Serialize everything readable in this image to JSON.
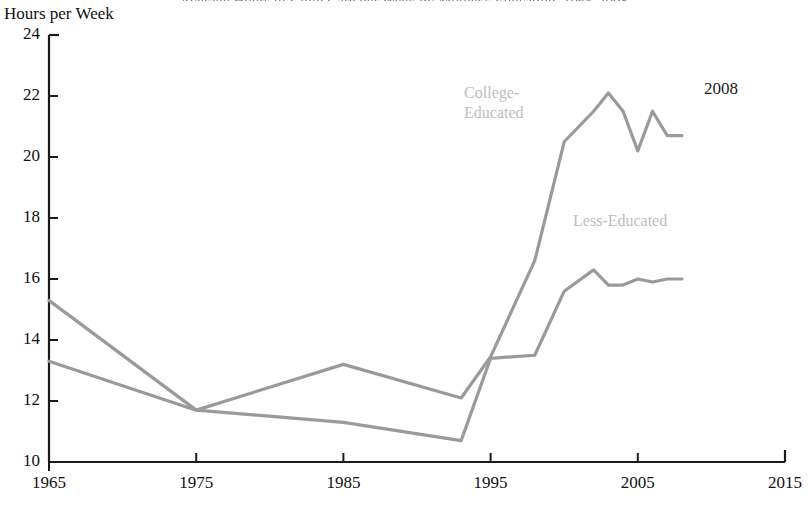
{
  "figure": {
    "clipped_title": "Average Hours of Child Care per Week by Mother's Education, 1965-2008",
    "y_axis_title": "Hours per Week",
    "annotation": "2008"
  },
  "chart_data": {
    "type": "line",
    "title": "",
    "xlabel": "",
    "ylabel": "Hours per Week",
    "xlim": [
      1965,
      2015
    ],
    "ylim": [
      10,
      24
    ],
    "xticks": [
      1965,
      1975,
      1985,
      1995,
      2005,
      2015
    ],
    "yticks": [
      10,
      12,
      14,
      16,
      18,
      20,
      22,
      24
    ],
    "grid": false,
    "legend_position": "inline-labels",
    "line_color": "#9a9a9a",
    "axis_color": "#1a1a1a",
    "label_color": "#bdbdbd",
    "annotations": [
      {
        "text": "2008",
        "x": 2009.5,
        "y": 22.2
      }
    ],
    "series": [
      {
        "name": "College-Educated",
        "label_lines": [
          "College-",
          "Educated"
        ],
        "label_x": 1993.2,
        "label_y": 22.1,
        "x": [
          1965,
          1975,
          1985,
          1993,
          1995,
          1998,
          2000,
          2002,
          2003,
          2004,
          2005,
          2006,
          2007,
          2008
        ],
        "values": [
          15.3,
          11.7,
          13.2,
          12.1,
          13.45,
          16.6,
          20.5,
          21.5,
          22.1,
          21.5,
          20.2,
          21.5,
          20.7,
          20.7
        ]
      },
      {
        "name": "Less-Educated",
        "label_lines": [
          "Less-Educated"
        ],
        "label_x": 2000.6,
        "label_y": 17.9,
        "x": [
          1965,
          1975,
          1985,
          1993,
          1995,
          1998,
          2000,
          2002,
          2003,
          2004,
          2005,
          2006,
          2007,
          2008
        ],
        "values": [
          13.3,
          11.7,
          11.3,
          10.7,
          13.4,
          13.5,
          15.6,
          16.3,
          15.8,
          15.8,
          16.0,
          15.9,
          16.0,
          16.0
        ]
      }
    ]
  }
}
